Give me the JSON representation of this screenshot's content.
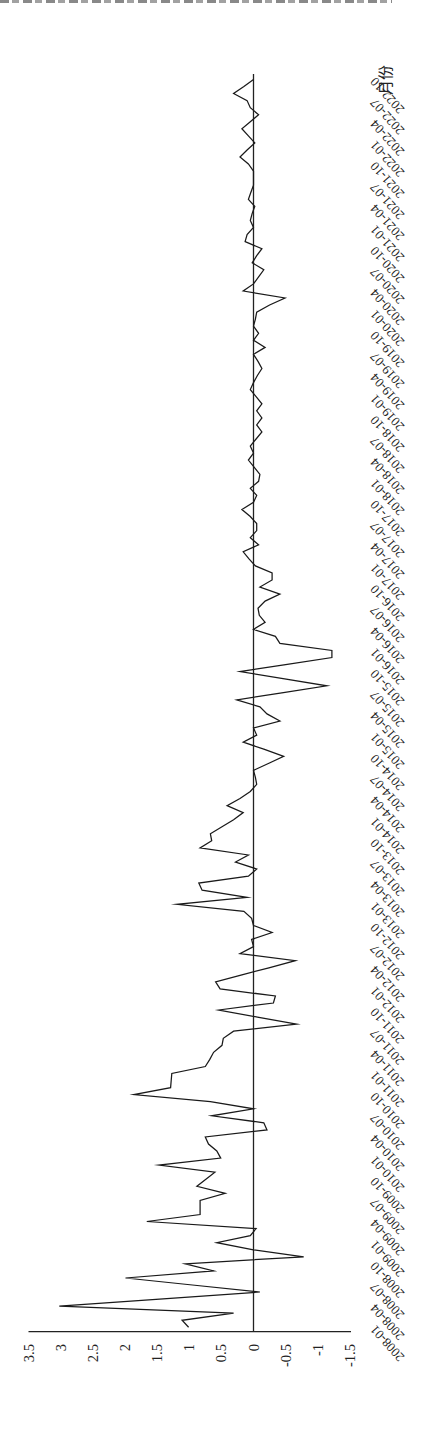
{
  "page": {
    "background": "#ffffff",
    "line_color": "#1a1a1a",
    "axis_color": "#222222"
  },
  "chart_data": {
    "type": "line",
    "title": "",
    "orientation": "rotated 90 degrees counter-clockwise (time runs bottom-to-top, values increase to the left)",
    "xlabel": "月份",
    "ylabel": "",
    "ylim": [
      -1.5,
      3.5
    ],
    "yticks": [
      3.5,
      3,
      2.5,
      2,
      1.5,
      1,
      0.5,
      0,
      -0.5,
      -1,
      -1.5
    ],
    "ytick_labels": [
      "3.5",
      "3",
      "2.5",
      "2",
      "1.5",
      "1",
      "0.5",
      "0",
      "-0.5",
      "-1",
      "-1.5"
    ],
    "grid": false,
    "legend": null,
    "zero_line": true,
    "x_tick_labels": [
      "2008-01",
      "2008-04",
      "2008-07",
      "2008-10",
      "2009-01",
      "2009-04",
      "2009-07",
      "2009-10",
      "2010-01",
      "2010-04",
      "2010-07",
      "2010-10",
      "2011-01",
      "2011-04",
      "2011-07",
      "2011-10",
      "2012-01",
      "2012-04",
      "2012-07",
      "2012-10",
      "2013-01",
      "2013-04",
      "2013-07",
      "2013-10",
      "2014-01",
      "2014-04",
      "2014-07",
      "2014-10",
      "2015-01",
      "2015-04",
      "2015-07",
      "2015-10",
      "2016-01",
      "2016-04",
      "2016-07",
      "2016-10",
      "2017-01",
      "2017-04",
      "2017-07",
      "2017-10",
      "2018-01",
      "2018-04",
      "2018-07",
      "2018-10",
      "2019-01",
      "2019-04",
      "2019-07",
      "2019-10",
      "2020-01",
      "2020-04",
      "2020-07",
      "2020-10",
      "2021-01",
      "2021-04",
      "2021-07",
      "2021-10",
      "2022-01",
      "2022-04",
      "2022-07",
      "2022-10"
    ],
    "x": [
      "2008-01",
      "2008-02",
      "2008-03",
      "2008-04",
      "2008-05",
      "2008-06",
      "2008-07",
      "2008-08",
      "2008-09",
      "2008-10",
      "2008-11",
      "2008-12",
      "2009-01",
      "2009-02",
      "2009-03",
      "2009-04",
      "2009-05",
      "2009-06",
      "2009-07",
      "2009-08",
      "2009-09",
      "2009-10",
      "2009-11",
      "2009-12",
      "2010-01",
      "2010-02",
      "2010-03",
      "2010-04",
      "2010-05",
      "2010-06",
      "2010-07",
      "2010-08",
      "2010-09",
      "2010-10",
      "2010-11",
      "2010-12",
      "2011-01",
      "2011-02",
      "2011-03",
      "2011-04",
      "2011-05",
      "2011-06",
      "2011-07",
      "2011-08",
      "2011-09",
      "2011-10",
      "2011-11",
      "2011-12",
      "2012-01",
      "2012-02",
      "2012-03",
      "2012-04",
      "2012-05",
      "2012-06",
      "2012-07",
      "2012-08",
      "2012-09",
      "2012-10",
      "2012-11",
      "2012-12",
      "2013-01",
      "2013-02",
      "2013-03",
      "2013-04",
      "2013-05",
      "2013-06",
      "2013-07",
      "2013-08",
      "2013-09",
      "2013-10",
      "2013-11",
      "2013-12",
      "2014-01",
      "2014-02",
      "2014-03",
      "2014-04",
      "2014-05",
      "2014-06",
      "2014-07",
      "2014-08",
      "2014-09",
      "2014-10",
      "2014-11",
      "2014-12",
      "2015-01",
      "2015-02",
      "2015-03",
      "2015-04",
      "2015-05",
      "2015-06",
      "2015-07",
      "2015-08",
      "2015-09",
      "2015-10",
      "2015-11",
      "2015-12",
      "2016-01",
      "2016-02",
      "2016-03",
      "2016-04",
      "2016-05",
      "2016-06",
      "2016-07",
      "2016-08",
      "2016-09",
      "2016-10",
      "2016-11",
      "2016-12",
      "2017-01",
      "2017-02",
      "2017-03",
      "2017-04",
      "2017-05",
      "2017-06",
      "2017-07",
      "2017-08",
      "2017-09",
      "2017-10",
      "2017-11",
      "2017-12",
      "2018-01",
      "2018-02",
      "2018-03",
      "2018-04",
      "2018-05",
      "2018-06",
      "2018-07",
      "2018-08",
      "2018-09",
      "2018-10",
      "2018-11",
      "2018-12",
      "2019-01",
      "2019-02",
      "2019-03",
      "2019-04",
      "2019-05",
      "2019-06",
      "2019-07",
      "2019-08",
      "2019-09",
      "2019-10",
      "2019-11",
      "2019-12",
      "2020-01",
      "2020-02",
      "2020-03",
      "2020-04",
      "2020-05",
      "2020-06",
      "2020-07",
      "2020-08",
      "2020-09",
      "2020-10",
      "2020-11",
      "2020-12",
      "2021-01",
      "2021-02",
      "2021-03",
      "2021-04",
      "2021-05",
      "2021-06",
      "2021-07",
      "2021-08",
      "2021-09",
      "2021-10",
      "2021-11",
      "2021-12",
      "2022-01",
      "2022-02",
      "2022-03",
      "2022-04",
      "2022-05",
      "2022-06",
      "2022-07",
      "2022-08",
      "2022-09",
      "2022-10"
    ],
    "values": [
      1.01,
      1.11,
      0.31,
      3.02,
      1.46,
      -0.1,
      0.95,
      1.99,
      0.62,
      1.06,
      -0.78,
      0.0,
      0.57,
      0.05,
      -0.04,
      1.66,
      0.83,
      0.83,
      0.83,
      0.44,
      0.88,
      0.74,
      0.6,
      1.47,
      0.51,
      0.57,
      0.7,
      0.75,
      -0.21,
      -0.16,
      0.65,
      0.0,
      0.67,
      1.86,
      1.29,
      1.28,
      1.27,
      0.75,
      0.68,
      0.62,
      0.49,
      0.47,
      0.31,
      -0.67,
      -0.06,
      0.54,
      -0.31,
      -0.34,
      0.52,
      0.59,
      0.18,
      -0.24,
      -0.65,
      0.21,
      0.0,
      0.03,
      -0.29,
      0.0,
      0.03,
      0.15,
      1.19,
      0.1,
      0.8,
      0.85,
      0.08,
      -0.05,
      0.28,
      0.08,
      0.83,
      0.65,
      0.67,
      0.49,
      0.31,
      0.16,
      0.41,
      0.21,
      0.05,
      -0.05,
      -0.03,
      0.0,
      -0.24,
      -0.47,
      -0.16,
      0.16,
      -0.05,
      0.0,
      -0.41,
      -0.21,
      -0.1,
      0.26,
      -0.44,
      -1.14,
      -0.46,
      0.21,
      -0.5,
      -1.22,
      -1.22,
      -0.41,
      -0.34,
      0.0,
      -0.18,
      -0.09,
      -0.07,
      -0.18,
      -0.41,
      -0.1,
      -0.29,
      -0.29,
      -0.03,
      0.07,
      0.16,
      -0.08,
      0.05,
      -0.05,
      -0.05,
      0.05,
      0.18,
      0.0,
      -0.05,
      0.05,
      -0.08,
      -0.1,
      -0.01,
      0.08,
      0.0,
      0.05,
      -0.04,
      -0.13,
      -0.05,
      -0.13,
      -0.05,
      -0.13,
      -0.04,
      0.05,
      0.0,
      -0.06,
      -0.13,
      -0.07,
      0.0,
      -0.18,
      0.0,
      -0.08,
      0.0,
      -0.03,
      -0.05,
      -0.25,
      -0.49,
      0.16,
      0.0,
      -0.08,
      -0.16,
      0.02,
      -0.05,
      -0.13,
      0.13,
      0.1,
      0.0,
      0.05,
      0.02,
      -0.02,
      0.08,
      0.04,
      0.0,
      0.0,
      0.0,
      0.08,
      0.21,
      0.1,
      -0.02,
      0.08,
      0.18,
      0.05,
      -0.08,
      0.05,
      0.1,
      0.31,
      0.15,
      0.0
    ]
  }
}
